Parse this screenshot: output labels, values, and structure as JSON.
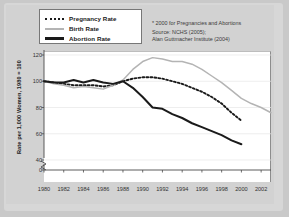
{
  "legend": {
    "items": [
      {
        "label": "Pregnancy Rate",
        "style": "dotted",
        "color": "#1a1a1a"
      },
      {
        "label": "Birth Rate",
        "style": "solid-thin",
        "color": "#b4b4b4"
      },
      {
        "label": "Abortion Rate",
        "style": "solid-thick",
        "color": "#1a1a1a"
      }
    ]
  },
  "notes": {
    "footnote": "* 2000 for Pregnancies and Abortions",
    "source_line1": "Source: NCHS (2005);",
    "source_line2": "Alan Guttmacher Institute (2004)"
  },
  "chart_data": {
    "type": "line",
    "title": "",
    "xlabel": "",
    "ylabel": "Rate per 1,000 Women, 1980 = 100",
    "xlim": [
      1980,
      2003
    ],
    "ylim": [
      35,
      122
    ],
    "grid": true,
    "axis_break": true,
    "ytick_labels": [
      "0",
      "40",
      "60",
      "80",
      "100",
      "120"
    ],
    "ytick_values": [
      0,
      40,
      60,
      80,
      100,
      120
    ],
    "xtick_labels": [
      "1980",
      "1982",
      "1984",
      "1986",
      "1988",
      "1990",
      "1992",
      "1994",
      "1996",
      "1998",
      "2000",
      "2002"
    ],
    "xtick_values": [
      1980,
      1982,
      1984,
      1986,
      1988,
      1990,
      1992,
      1994,
      1996,
      1998,
      2000,
      2002
    ],
    "legend_position": "top-left",
    "series": [
      {
        "name": "Pregnancy Rate",
        "color": "#1a1a1a",
        "style": "dotted",
        "x": [
          1980,
          1981,
          1982,
          1983,
          1984,
          1985,
          1986,
          1987,
          1988,
          1989,
          1990,
          1991,
          1992,
          1993,
          1994,
          1995,
          1996,
          1997,
          1998,
          1999,
          2000
        ],
        "values": [
          100,
          99,
          98,
          97,
          97,
          97,
          96,
          97,
          100,
          102,
          103,
          103,
          102,
          100,
          98,
          95,
          92,
          88,
          83,
          76,
          70
        ]
      },
      {
        "name": "Birth Rate",
        "color": "#b4b4b4",
        "style": "solid-thin",
        "x": [
          1980,
          1981,
          1982,
          1983,
          1984,
          1985,
          1986,
          1987,
          1988,
          1989,
          1990,
          1991,
          1992,
          1993,
          1994,
          1995,
          1996,
          1997,
          1998,
          1999,
          2000,
          2001,
          2002,
          2003
        ],
        "values": [
          100,
          98,
          97,
          95,
          96,
          95,
          94,
          97,
          101,
          109,
          115,
          118,
          117,
          115,
          115,
          113,
          109,
          104,
          99,
          93,
          87,
          83,
          80,
          76
        ]
      },
      {
        "name": "Abortion Rate",
        "color": "#1a1a1a",
        "style": "solid-thick",
        "x": [
          1980,
          1981,
          1982,
          1983,
          1984,
          1985,
          1986,
          1987,
          1988,
          1989,
          1990,
          1991,
          1992,
          1993,
          1994,
          1995,
          1996,
          1997,
          1998,
          1999,
          2000
        ],
        "values": [
          100,
          99,
          99,
          101,
          99,
          101,
          99,
          98,
          100,
          95,
          88,
          80,
          79,
          75,
          72,
          68,
          65,
          62,
          59,
          55,
          52
        ]
      }
    ]
  }
}
